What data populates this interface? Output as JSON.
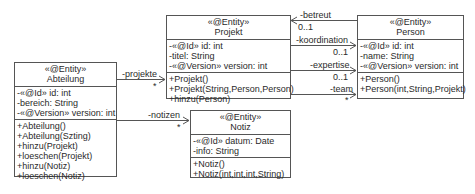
{
  "classes": {
    "abteilung": {
      "stereotype": "«@Entity»",
      "name": "Abteilung",
      "attributes": [
        "-«@Id» id: int",
        "-bereich: String",
        "-«@Version» version: int"
      ],
      "operations": [
        "+Abteilung()",
        "+Abteilung(Szting)",
        "+hinzu(Projekt)",
        "+loeschen(Projekt)",
        "+hinzu(Notiz)",
        "+loeschen(Notiz)"
      ]
    },
    "projekt": {
      "stereotype": "«@Entity»",
      "name": "Projekt",
      "attributes": [
        "-«@Id» id: int",
        "-titel: String",
        "-«@Version» version: int"
      ],
      "operations": [
        "+Projekt()",
        "+Projekt(String,Person,Person)",
        "+hinzu(Person)"
      ]
    },
    "person": {
      "stereotype": "«@Entity»",
      "name": "Person",
      "attributes": [
        "-«@Id» id: int",
        "-name: String",
        "-«@Version» version: int"
      ],
      "operations": [
        "+Person()",
        "+Person(int,String,Projekt)"
      ]
    },
    "notiz": {
      "stereotype": "«@Entity»",
      "name": "Notiz",
      "attributes": [
        "-«@Id» datum: Date",
        "-info: String"
      ],
      "operations": [
        "+Notiz()",
        "+Notiz(int,int,int,String)"
      ]
    }
  },
  "associations": {
    "projekte": {
      "role": "-projekte",
      "multiplicity": "*"
    },
    "notizen": {
      "role": "-notizen",
      "multiplicity": "*"
    },
    "betreut": {
      "role": "-betreut",
      "multiplicity": "0..1"
    },
    "koordination": {
      "role": "-koordination",
      "multiplicity": "0..1"
    },
    "expertise": {
      "role": "-expertise",
      "multiplicity": "0..1"
    },
    "team": {
      "role": "-team",
      "multiplicity": "*"
    }
  }
}
